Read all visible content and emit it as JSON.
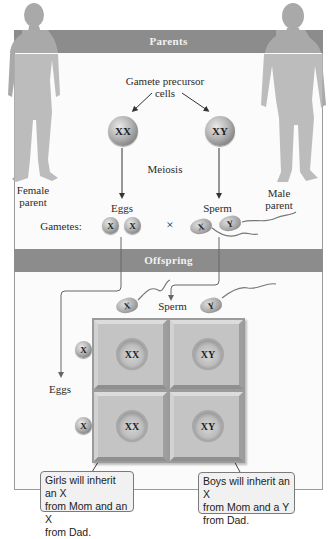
{
  "figure": {
    "sections": {
      "parents_header": "Parents",
      "offspring_header": "Offspring"
    },
    "parents": {
      "precursor_label_line1": "Gamete precursor",
      "precursor_label_line2": "cells",
      "female_cell": "XX",
      "male_cell": "XY",
      "process_label": "Meiosis",
      "female_label_line1": "Female",
      "female_label_line2": "parent",
      "male_label_line1": "Male",
      "male_label_line2": "parent",
      "eggs_label": "Eggs",
      "sperm_label": "Sperm",
      "gametes_label": "Gametes:",
      "egg_gametes": [
        "X",
        "X"
      ],
      "cross_symbol": "×",
      "sperm_gametes": [
        "X",
        "Y"
      ]
    },
    "offspring": {
      "sperm_label": "Sperm",
      "eggs_label": "Eggs",
      "sperm_column_headers": [
        "X",
        "Y"
      ],
      "egg_row_headers": [
        "X",
        "X"
      ],
      "punnett_cells": [
        [
          "XX",
          "XY"
        ],
        [
          "XX",
          "XY"
        ]
      ],
      "callout_girls": {
        "line1": "Girls will inherit an X",
        "line2": "from Mom and an X",
        "line3": "from Dad."
      },
      "callout_boys": {
        "line1": "Boys will inherit an X",
        "line2": "from Mom and a Y",
        "line3": "from Dad."
      }
    },
    "colors": {
      "header_band": "#8c8c8c",
      "silhouette": "#a9a9a9",
      "punnett_cell": "#c4c4c4",
      "callout_bg": "#f1f1f1"
    }
  }
}
